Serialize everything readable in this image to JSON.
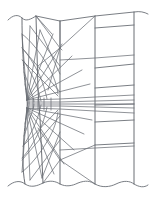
{
  "figure": {
    "kind": "line-diagram",
    "width": 155,
    "height": 200,
    "background_color": "#ffffff"
  },
  "style": {
    "line_color": "#6b6f76",
    "line_color_dark": "#5a5e64",
    "line_width_main": 0.9,
    "line_width_thin": 0.75,
    "break_line_color": "#6b6f76",
    "break_line_width": 0.9
  },
  "geometry": {
    "pinch_point": {
      "x": 27,
      "y": 104
    },
    "left_boundary_waist_x": 23,
    "top_break_y": 18,
    "bottom_break_y": 182,
    "vertical_rails_x": [
      43,
      60,
      95,
      134
    ],
    "right_panel_rows_y": [
      28,
      68,
      88,
      105,
      122,
      145
    ]
  },
  "paths": {
    "top_break": "M 8,20 C 13,15 18,14 22,18 C 26,22 31,19 36,16 L 60,21 L 95,16 L 134,12 C 140,11 144,12 148,14",
    "bottom_break": "M 8,186 C 14,181 20,180 25,184 C 31,188 37,186 43,183 C 50,180 55,181 60,184 C 66,187 72,186 78,183 C 86,180 90,181 95,184 C 102,188 110,187 116,184 C 124,180 130,181 134,184 C 139,187 144,188 148,185",
    "left_boundary": "M 22,18 C 22,40 23,58 24,72 C 25,84 26,92 27,100 C 27.5,102 27.5,106 27,108 C 26,116 25,124 24,136 C 23,152 22,168 25,184",
    "rail_43": "M 36,16 L 38,90 L 39,104 L 40,118 L 43,183",
    "rail_60": "M 60,21 L 60,104 L 60,184",
    "rail_95": "M 95,16 L 95,104 L 95,184",
    "rail_134": "M 134,12 L 134,104 L 134,184"
  },
  "groups": {
    "upper_fan_label": "upper radial fan",
    "lower_fan_label": "lower radial fan",
    "upper_arcs_label": "upper orthogonal arcs",
    "lower_arcs_label": "lower orthogonal arcs",
    "core_band_label": "central parallel band",
    "right_grid_label": "right orthogonal grid",
    "diagonal_label": "long diagonals"
  },
  "upper_fan": [
    "M 27,100 L 22,34",
    "M 27,100 L 30,26",
    "M 27,100 L 40,30",
    "M 27,100 L 53,34",
    "M 27,100 L 62,44",
    "M 27,100 L 72,56",
    "M 27,100 L 82,70",
    "M 27,100 L 90,84"
  ],
  "lower_fan": [
    "M 27,108 L 22,172",
    "M 27,108 L 30,180",
    "M 27,108 L 42,178",
    "M 27,108 L 54,174",
    "M 27,108 L 64,164",
    "M 27,108 L 74,150",
    "M 27,108 L 84,134",
    "M 27,108 L 92,120"
  ],
  "upper_arcs": [
    "M 22,34 C 30,40 40,52 48,66 C 54,76 57,86 58,94",
    "M 22,48 C 28,54 34,64 40,76 C 44,86 46,94 47,99",
    "M 23,60 C 27,66 32,74 36,84 C 39,92 40,97 41,101",
    "M 24,72 C 26,78 29,85 31,92 C 33,97 34,100 34,102",
    "M 25,84 C 26,88 27,93 28,97 C 29,100 29,101 29,103"
  ],
  "lower_arcs": [
    "M 22,172 C 30,166 40,154 48,140 C 54,130 57,120 58,112",
    "M 22,158 C 28,152 34,142 40,130 C 44,120 46,112 47,107",
    "M 23,146 C 27,140 32,132 36,122 C 39,114 40,109 41,105",
    "M 24,136 C 26,130 29,122 31,115 C 33,110 34,106 34,104",
    "M 25,124 C 26,119 27,114 28,110 C 29,106 29,105 29,103"
  ],
  "core_band": [
    "M 27,100 L 60,99 L 95,97 L 134,95",
    "M 27,102 L 60,102 L 95,101 L 134,100",
    "M 27,104 L 60,104 L 95,104 L 134,104",
    "M 27,106 L 60,106 L 95,107 L 134,108",
    "M 27,108 L 60,109 L 95,111 L 134,113"
  ],
  "core_ticks": [
    "M 33,99 L 33,109",
    "M 38,98 L 38,110",
    "M 44,98 L 44,110",
    "M 51,98 L 51,110"
  ],
  "right_grid": [
    "M 95,28 L 134,25",
    "M 95,68 L 134,64",
    "M 95,88 L 134,85",
    "M 95,105 L 134,104",
    "M 95,122 L 134,120",
    "M 95,145 L 134,143"
  ],
  "right_grid_long": [
    "M 60,60 L 95,58 L 134,55",
    "M 60,150 L 95,148 L 134,146"
  ],
  "diagonals": [
    "M 36,16 L 60,48 L 62,50",
    "M 60,21 L 60,46",
    "M 95,16 L 60,48",
    "M 60,48 L 38,66",
    "M 60,48 L 48,90",
    "M 36,16 L 52,34",
    "M 60,160 L 95,184",
    "M 60,160 L 43,183",
    "M 60,160 L 38,128",
    "M 95,145 L 60,160",
    "M 30,180 L 60,140",
    "M 30,26 L 60,66"
  ],
  "extra_diagonals": [
    "M 22,48 L 60,92",
    "M 22,60 L 58,96",
    "M 22,160 L 60,116",
    "M 23,146 L 58,110",
    "M 40,30 L 60,74",
    "M 42,178 L 60,132"
  ]
}
